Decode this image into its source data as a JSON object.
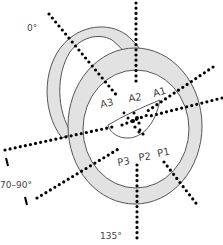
{
  "diagram": {
    "title": "",
    "colors": {
      "ring_fill": "#e2e2e2",
      "ring_stroke": "#555555",
      "dots": "#000000",
      "text": "#444444",
      "background": "#ffffff"
    },
    "angle_labels": {
      "top_left": "0°",
      "left": "70–90°",
      "bottom": "135°"
    },
    "anterior_labels": [
      "A1",
      "A2",
      "A3"
    ],
    "posterior_labels": [
      "P1",
      "P2",
      "P3"
    ]
  }
}
